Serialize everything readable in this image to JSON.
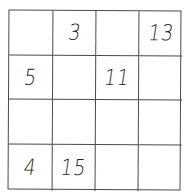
{
  "puzzle": {
    "type": "magic-square-grid",
    "rows": 4,
    "cols": 4,
    "cells": [
      [
        "",
        "3",
        "",
        "13"
      ],
      [
        "5",
        "",
        "11",
        ""
      ],
      [
        "",
        "",
        "",
        ""
      ],
      [
        "4",
        "15",
        "",
        ""
      ]
    ]
  }
}
